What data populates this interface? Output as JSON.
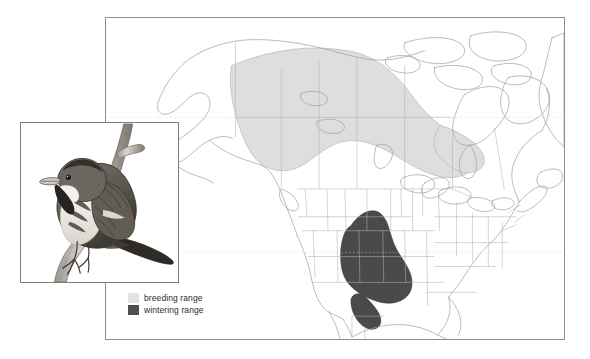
{
  "figure": {
    "background_color": "#ffffff"
  },
  "map": {
    "name": "north-america-range-map",
    "frame_color": "#8e8e8e",
    "land_outline_color": "#9a9a9a",
    "border_line_color": "#a8a8a8",
    "projection_note": "North America, Alaska through Greenland"
  },
  "legend": {
    "items": [
      {
        "label": "breeding range",
        "color": "#e3e3e3",
        "icon": "color-swatch-icon"
      },
      {
        "label": "wintering range",
        "color": "#4f4f4f",
        "icon": "color-swatch-icon"
      }
    ]
  },
  "ranges": {
    "breeding": {
      "label": "breeding range",
      "fill": "#dedede",
      "stroke": "#b9b9b9",
      "region_description": "Diagonal band across northern Canada from Alaska and Yukon southeast to Hudson Bay and Labrador"
    },
    "wintering": {
      "label": "wintering range",
      "fill": "#4a4a4a",
      "stroke": "#3a3a3a",
      "region_description": "South-central United States centered on Arkansas, Louisiana, Mississippi and eastern Texas"
    }
  },
  "inset": {
    "name": "bird-illustration",
    "caption": "",
    "description": "Pen-and-ink illustration of a streaked sparrow perched on a vertical branch",
    "frame_color": "#7d7d7d"
  }
}
